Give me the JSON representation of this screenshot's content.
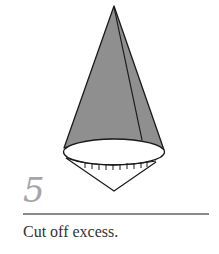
{
  "figure": {
    "step_number": "5",
    "caption": "Cut off excess.",
    "colors": {
      "cone_fill": "#8f8f8f",
      "outline": "#1a1a1a",
      "number": "#a5a5a5",
      "rule": "#8a8a8a",
      "caption": "#333333"
    }
  }
}
